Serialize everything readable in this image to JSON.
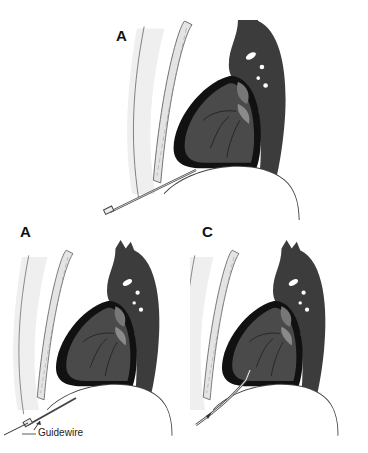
{
  "figure": {
    "panels": [
      {
        "id": "A",
        "label": "A",
        "stage": "needle inserted into pericardial effusion"
      },
      {
        "id": "B",
        "label": "B",
        "stage": "guidewire advanced through needle",
        "callout": "Guidewire"
      },
      {
        "id": "C",
        "label": "C",
        "stage": "catheter placed over guidewire"
      }
    ],
    "colors": {
      "heart": "#4a4a4a",
      "effusion": "#111111",
      "great_vessels": "#3a3a3a",
      "sternum": "#e8e8e8",
      "outline": "#555555",
      "background": "#ffffff"
    }
  }
}
